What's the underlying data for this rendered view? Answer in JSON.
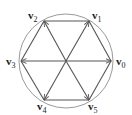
{
  "diagram": {
    "title": "",
    "circle": {
      "cx": 66,
      "cy": 61,
      "r": 47,
      "stroke": "#9a9a9a"
    },
    "center": {
      "x": 66,
      "y": 61
    },
    "line_color": "#555555",
    "vertices": [
      {
        "id": "v0",
        "base": "v",
        "sub": "0",
        "x": 111,
        "y": 61,
        "label_x": 116,
        "label_y": 65
      },
      {
        "id": "v1",
        "base": "v",
        "sub": "1",
        "x": 89,
        "y": 21,
        "label_x": 92,
        "label_y": 19
      },
      {
        "id": "v2",
        "base": "v",
        "sub": "2",
        "x": 44,
        "y": 21,
        "label_x": 28,
        "label_y": 19
      },
      {
        "id": "v3",
        "base": "v",
        "sub": "3",
        "x": 21,
        "y": 61,
        "label_x": 6,
        "label_y": 65
      },
      {
        "id": "v4",
        "base": "v",
        "sub": "4",
        "x": 44,
        "y": 100,
        "label_x": 37,
        "label_y": 110
      },
      {
        "id": "v5",
        "base": "v",
        "sub": "5",
        "x": 89,
        "y": 100,
        "label_x": 88,
        "label_y": 110
      }
    ],
    "edges": [
      [
        "v0",
        "v1"
      ],
      [
        "v1",
        "v2"
      ],
      [
        "v2",
        "v3"
      ],
      [
        "v3",
        "v4"
      ],
      [
        "v4",
        "v5"
      ],
      [
        "v5",
        "v0"
      ]
    ],
    "arrows_from_center": [
      "v0",
      "v1",
      "v2",
      "v3",
      "v4",
      "v5"
    ]
  }
}
